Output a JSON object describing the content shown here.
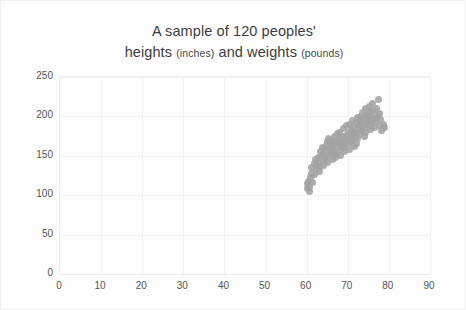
{
  "chart_data": {
    "type": "scatter",
    "title": "A sample of 120 peoples' heights (inches) and weights (pounds)",
    "title_line1": "A sample of 120 peoples'",
    "title_line2_a": "heights ",
    "title_line2_unit1": "(inches)",
    "title_line2_b": " and weights ",
    "title_line2_unit2": "(pounds)",
    "xlabel": "",
    "ylabel": "",
    "xlim": [
      0,
      90
    ],
    "ylim": [
      0,
      250
    ],
    "xticks": [
      0,
      10,
      20,
      30,
      40,
      50,
      60,
      70,
      80,
      90
    ],
    "yticks": [
      0,
      50,
      100,
      150,
      200,
      250
    ],
    "grid": true,
    "legend": false,
    "point_color": "#a3a3a3",
    "n_points": 120,
    "series": [
      {
        "name": "people",
        "x": [
          60.2,
          60.4,
          60.6,
          60.5,
          60.8,
          60.3,
          61.0,
          61.2,
          61.5,
          61.1,
          61.8,
          62.0,
          62.3,
          62.1,
          62.5,
          62.8,
          63.0,
          63.2,
          63.4,
          63.1,
          63.6,
          63.8,
          64.0,
          64.2,
          64.1,
          64.4,
          64.6,
          64.8,
          65.0,
          65.2,
          65.1,
          65.4,
          65.6,
          65.3,
          65.8,
          66.0,
          66.2,
          66.1,
          66.4,
          66.6,
          66.3,
          66.8,
          67.0,
          67.2,
          67.1,
          67.4,
          67.6,
          67.3,
          67.8,
          68.0,
          68.2,
          68.1,
          68.4,
          68.6,
          68.3,
          68.8,
          69.0,
          69.2,
          69.1,
          69.4,
          69.6,
          69.3,
          69.8,
          70.0,
          70.2,
          70.1,
          70.4,
          70.6,
          70.3,
          70.8,
          71.0,
          71.2,
          71.1,
          71.4,
          71.6,
          71.3,
          71.8,
          72.0,
          72.2,
          72.1,
          72.4,
          72.6,
          72.3,
          72.8,
          73.0,
          73.2,
          73.1,
          73.4,
          73.6,
          73.3,
          73.8,
          74.0,
          74.2,
          74.1,
          74.4,
          74.6,
          74.3,
          74.8,
          75.0,
          75.2,
          75.1,
          75.4,
          75.6,
          75.3,
          75.8,
          76.0,
          76.2,
          76.1,
          76.4,
          76.6,
          76.8,
          77.0,
          77.2,
          77.4,
          77.6,
          77.8,
          78.0,
          78.3,
          78.6,
          79.0
        ],
        "y": [
          108,
          112,
          105,
          118,
          110,
          115,
          122,
          128,
          116,
          135,
          140,
          126,
          132,
          145,
          138,
          148,
          130,
          142,
          155,
          136,
          150,
          160,
          144,
          152,
          138,
          158,
          147,
          163,
          142,
          156,
          168,
          149,
          160,
          172,
          153,
          165,
          145,
          158,
          170,
          150,
          162,
          175,
          155,
          168,
          148,
          160,
          178,
          152,
          165,
          172,
          158,
          180,
          166,
          174,
          150,
          162,
          185,
          170,
          155,
          168,
          176,
          160,
          188,
          172,
          165,
          180,
          158,
          175,
          190,
          168,
          182,
          170,
          195,
          178,
          162,
          186,
          174,
          192,
          180,
          166,
          198,
          185,
          172,
          190,
          200,
          178,
          194,
          182,
          205,
          188,
          196,
          175,
          202,
          186,
          210,
          192,
          180,
          198,
          188,
          206,
          194,
          212,
          184,
          200,
          190,
          208,
          196,
          216,
          186,
          202,
          194,
          210,
          198,
          222,
          188,
          204,
          196,
          182,
          190,
          186
        ]
      }
    ]
  }
}
